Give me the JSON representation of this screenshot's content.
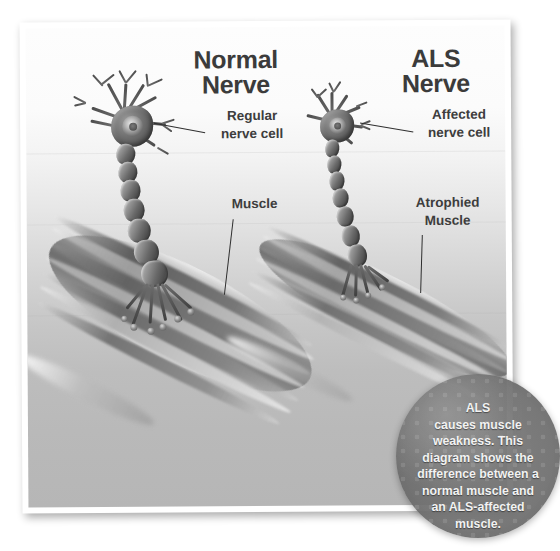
{
  "figure": {
    "alt_title": "Normal nerve and muscle compared with ALS nerve and atrophied muscle",
    "panels": [
      {
        "id": "normal",
        "title": "Normal\nNerve"
      },
      {
        "id": "als",
        "title": "ALS\nNerve"
      }
    ],
    "labels": {
      "regular_nerve_cell": "Regular\nnerve cell",
      "affected_nerve_cell": "Affected\nnerve cell",
      "muscle": "Muscle",
      "atrophied_muscle": "Atrophied\nMuscle"
    },
    "badge": {
      "text": "ALS\ncauses muscle\nweakness. This\ndiagram shows the\ndifference between a\nnormal muscle and\nan ALS-affected\nmuscle."
    },
    "colors": {
      "text": "#3b3b3b",
      "label_text": "#3d3d3d",
      "badge_fill": "#6e6e6e",
      "badge_text": "#f2f2f2",
      "leader_line": "#2f2f2f",
      "background_top": "#fdfdfd",
      "background_bottom": "#b6b6b6"
    }
  }
}
